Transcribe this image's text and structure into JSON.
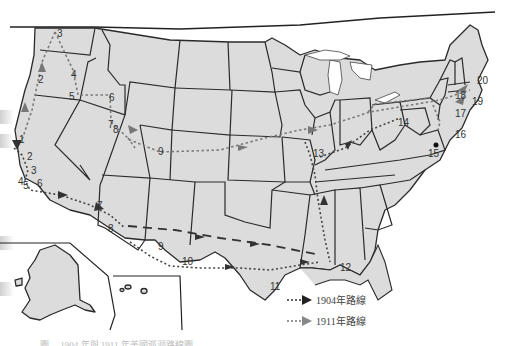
{
  "map": {
    "title": "Routes map (United States)",
    "colors": {
      "land": "#dcdcdc",
      "border": "#2a2a2a",
      "route_1904": "#333333",
      "route_1911": "#7a7a7a",
      "background": "#ffffff"
    },
    "stops_1904": [
      "1",
      "2",
      "3",
      "4",
      "5",
      "6",
      "7",
      "8",
      "9",
      "10",
      "11",
      "12"
    ],
    "stops_1911": [
      "1",
      "2",
      "3",
      "4",
      "5",
      "6",
      "7",
      "8",
      "9",
      "13",
      "14",
      "15",
      "16",
      "17",
      "18",
      "19",
      "20"
    ],
    "labels": {
      "s1a": "1",
      "s2a": "2",
      "s3a": "3",
      "s4a": "4",
      "s5a": "5",
      "s6a": "6",
      "s7a": "7",
      "s8a": "8",
      "s9a": "9",
      "s10": "10",
      "s11": "11",
      "s12": "12",
      "n3": "3",
      "n2": "2",
      "n4": "4",
      "n5": "5",
      "n6": "6",
      "n7": "7",
      "n8": "8",
      "n9": "9",
      "n13": "13",
      "n14": "14",
      "n15": "15",
      "n16": "16",
      "n17": "17",
      "n18": "18",
      "n19": "19",
      "n20": "20",
      "w1": "1",
      "w2": "2",
      "w3": "3",
      "w4": "4",
      "w5": "5",
      "w6": "6",
      "w7": "7",
      "w8": "8"
    }
  },
  "legend": {
    "items": [
      {
        "label": "1904年路線",
        "arrow": "dark-arrow"
      },
      {
        "label": "1911年路線",
        "arrow": "gray-arrow"
      }
    ]
  },
  "caption": {
    "text": "圖 ... 1904 年與 1911 年美國巡迴路線圖"
  }
}
